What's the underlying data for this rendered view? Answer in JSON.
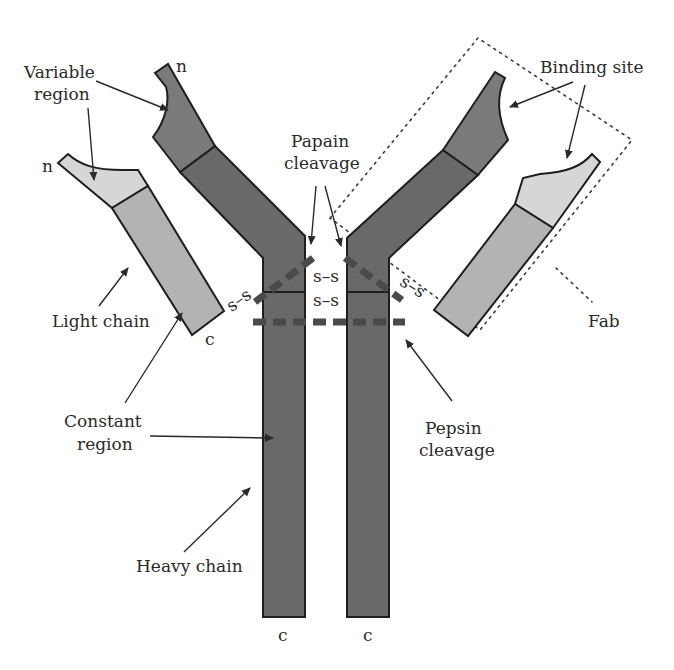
{
  "diagram": {
    "type": "antibody-structure",
    "colors": {
      "heavy_variable": "#7a7a7a",
      "heavy_constant": "#696969",
      "light_variable": "#d6d6d6",
      "light_constant": "#b3b3b3",
      "cleavage_dash": "#4a4a4a",
      "outline": "#1e1e1e",
      "background": "#ffffff"
    },
    "labels": {
      "variable_region_line1": "Variable",
      "variable_region_line2": "region",
      "binding_site": "Binding site",
      "papain_line1": "Papain",
      "papain_line2": "cleavage",
      "light_chain": "Light chain",
      "fab": "Fab",
      "constant_line1": "Constant",
      "constant_line2": "region",
      "pepsin_line1": "Pepsin",
      "pepsin_line2": "cleavage",
      "heavy_chain": "Heavy chain"
    },
    "terminals": {
      "n_heavy_left": "n",
      "n_light_left": "n",
      "c_light_left": "c",
      "c_heavy_left": "c",
      "c_heavy_right": "c"
    },
    "disulfide_bonds": {
      "left_light_heavy": "s–s",
      "right_light_heavy": "s–s",
      "hinge_upper": "s–s",
      "hinge_lower": "s–s"
    }
  }
}
